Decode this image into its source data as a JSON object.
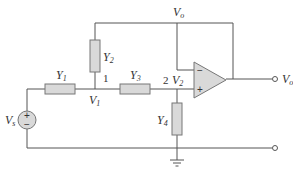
{
  "diagram": {
    "type": "op-amp filter circuit",
    "labels": {
      "output_node": {
        "main": "V",
        "sub": "o"
      },
      "output_terminal": {
        "main": "V",
        "sub": "o"
      },
      "source": {
        "main": "V",
        "sub": "s"
      },
      "node1_voltage": {
        "main": "V",
        "sub": "1"
      },
      "node2_voltage": {
        "main": "V",
        "sub": "2"
      },
      "node1_number": "1",
      "node2_number": "2"
    },
    "components": [
      {
        "id": "Y1",
        "main": "Y",
        "sub": "1",
        "orientation": "horizontal"
      },
      {
        "id": "Y2",
        "main": "Y",
        "sub": "2",
        "orientation": "vertical"
      },
      {
        "id": "Y3",
        "main": "Y",
        "sub": "3",
        "orientation": "horizontal"
      },
      {
        "id": "Y4",
        "main": "Y",
        "sub": "4",
        "orientation": "vertical"
      }
    ],
    "opamp": {
      "inverting": "−",
      "noninverting": "+"
    },
    "source_signs": {
      "plus": "+",
      "minus": "−"
    },
    "colors": {
      "wire": "#555555",
      "component_fill": "#d9d9d9",
      "component_stroke": "#777777"
    }
  }
}
